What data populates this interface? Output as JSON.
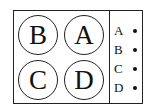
{
  "diagram": {
    "circles": [
      {
        "label": "B",
        "position": "top-left"
      },
      {
        "label": "A",
        "position": "top-right"
      },
      {
        "label": "C",
        "position": "bottom-left"
      },
      {
        "label": "D",
        "position": "bottom-right"
      }
    ],
    "legend": [
      {
        "label": "A",
        "marker": "dot"
      },
      {
        "label": "B",
        "marker": "dot"
      },
      {
        "label": "C",
        "marker": "dot"
      },
      {
        "label": "D",
        "marker": "dot"
      }
    ],
    "colors": {
      "stroke": "#222222",
      "background": "#ffffff"
    }
  }
}
